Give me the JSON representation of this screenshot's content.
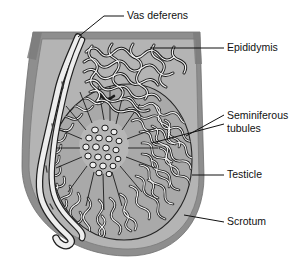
{
  "figure": {
    "background_color": "#ffffff"
  },
  "colors": {
    "background": "#ffffff",
    "scrotum_outer_wall": "#8c8c8c",
    "scrotum_inner": "#b2b2b2",
    "testicle_fill": "#a8a8a8",
    "tubule_stroke": "#1a1a1a",
    "tubule_fill": "#f0f0f0",
    "vas_deferens_fill": "#ededed",
    "vas_deferens_stroke": "#2a2a2a",
    "leader_line": "#111111",
    "label_text": "#111111"
  },
  "labels": [
    {
      "id": "vas-deferens",
      "text": "Vas deferens",
      "x": 127,
      "y": 16,
      "lines": [
        "Vas deferens"
      ]
    },
    {
      "id": "epididymis",
      "text": "Epididymis",
      "x": 227,
      "y": 48,
      "lines": [
        "Epididymis"
      ]
    },
    {
      "id": "seminiferous-tubules",
      "text": "Seminiferous tubules",
      "x": 227,
      "y": 121,
      "lines": [
        "Seminiferous",
        "tubules"
      ]
    },
    {
      "id": "testicle",
      "text": "Testicle",
      "x": 227,
      "y": 175,
      "lines": [
        "Testicle"
      ]
    },
    {
      "id": "scrotum",
      "text": "Scrotum",
      "x": 227,
      "y": 222,
      "lines": [
        "Scrotum"
      ]
    }
  ],
  "leader_lines": [
    {
      "id": "leader-vas-deferens",
      "path": "M 124 16 L 104 16 L 78 37"
    },
    {
      "id": "leader-epididymis",
      "path": "M 224 48 L 150 48"
    },
    {
      "id": "leader-seminiferous-1",
      "path": "M 224 115 L 186 136"
    },
    {
      "id": "leader-seminiferous-2",
      "path": "M 224 124 L 152 143"
    },
    {
      "id": "leader-testicle",
      "path": "M 224 175 L 192 175"
    },
    {
      "id": "leader-scrotum",
      "path": "M 224 222 L 184 215"
    }
  ],
  "anatomy": {
    "scrotum_outline": "M 33 32 L 200 32 L 204 176 C 204 226 172 256 128 256 C 70 256 22 218 22 166 C 22 120 27 70 33 32 Z",
    "scrotum_inner_outline": "M 42 39 L 196 39 L 199 177 C 199 222 170 249 128 249 C 74 249 29 214 29 166 C 29 122 36 74 42 39 Z",
    "testicle_outline": "M 130 84 C 167 84 192 118 192 160 C 192 207 163 240 124 240 C 82 240 52 205 52 160 C 52 116 88 84 130 84 Z",
    "rete_testis_center": {
      "x": 104,
      "y": 146,
      "rx": 24,
      "ry": 26
    }
  }
}
